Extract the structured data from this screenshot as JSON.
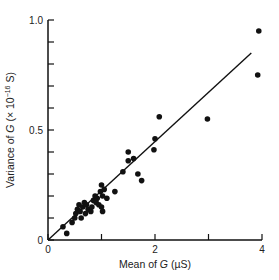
{
  "chart_data": {
    "type": "scatter",
    "title": "",
    "xlabel": "Mean of G (µS)",
    "ylabel": "Variance of G (×10⁻¹⁶ S)",
    "xlim": [
      0,
      4
    ],
    "ylim": [
      0,
      1.0
    ],
    "x_ticks": [
      0,
      1,
      2,
      3,
      4
    ],
    "x_tick_labels": [
      "0",
      "",
      "2",
      "",
      "4"
    ],
    "y_ticks": [
      0,
      0.1,
      0.2,
      0.3,
      0.4,
      0.5,
      0.6,
      0.7,
      0.8,
      0.9,
      1.0
    ],
    "y_tick_labels": [
      "0",
      "",
      "",
      "",
      "",
      "0.5",
      "",
      "",
      "",
      "",
      "1.0"
    ],
    "grid": false,
    "legend": null,
    "series": [
      {
        "name": "measurements",
        "points": [
          [
            0.28,
            0.06
          ],
          [
            0.35,
            0.03
          ],
          [
            0.45,
            0.08
          ],
          [
            0.5,
            0.1
          ],
          [
            0.52,
            0.12
          ],
          [
            0.55,
            0.14
          ],
          [
            0.58,
            0.16
          ],
          [
            0.6,
            0.13
          ],
          [
            0.62,
            0.1
          ],
          [
            0.65,
            0.15
          ],
          [
            0.68,
            0.17
          ],
          [
            0.7,
            0.12
          ],
          [
            0.72,
            0.16
          ],
          [
            0.75,
            0.14
          ],
          [
            0.8,
            0.13
          ],
          [
            0.82,
            0.15
          ],
          [
            0.85,
            0.18
          ],
          [
            0.88,
            0.2
          ],
          [
            0.9,
            0.17
          ],
          [
            0.92,
            0.19
          ],
          [
            0.95,
            0.16
          ],
          [
            0.98,
            0.22
          ],
          [
            1.0,
            0.25
          ],
          [
            1.02,
            0.2
          ],
          [
            1.05,
            0.23
          ],
          [
            1.0,
            0.15
          ],
          [
            1.02,
            0.13
          ],
          [
            1.1,
            0.19
          ],
          [
            1.25,
            0.22
          ],
          [
            1.5,
            0.4
          ],
          [
            1.5,
            0.36
          ],
          [
            1.6,
            0.37
          ],
          [
            1.68,
            0.3
          ],
          [
            1.75,
            0.27
          ],
          [
            1.4,
            0.31
          ],
          [
            1.98,
            0.41
          ],
          [
            2.0,
            0.46
          ],
          [
            2.08,
            0.56
          ],
          [
            2.98,
            0.55
          ],
          [
            3.92,
            0.75
          ],
          [
            3.94,
            0.95
          ]
        ]
      }
    ],
    "fit_line": {
      "x": [
        0,
        3.8
      ],
      "y": [
        0,
        0.85
      ]
    }
  },
  "axes": {
    "x_label_prefix": "Mean of ",
    "x_label_var": "G",
    "x_label_unit": " (µS)",
    "y_label_prefix": "Variance of ",
    "y_label_var": "G",
    "y_label_unit_pre": " (× 10",
    "y_label_exp": "−16",
    "y_label_unit_post": " S)"
  }
}
